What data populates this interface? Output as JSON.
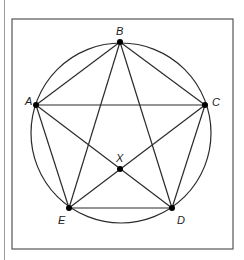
{
  "diagram": {
    "title": "",
    "frame": {
      "x": 12,
      "y": 19,
      "width": 221,
      "height": 230
    },
    "circle": {
      "cx": 121,
      "cy": 133,
      "r": 90
    },
    "points": {
      "A": {
        "label": "A",
        "x": 36,
        "y": 105,
        "label_x": 25,
        "label_y": 105
      },
      "B": {
        "label": "B",
        "x": 120,
        "y": 42,
        "label_x": 116,
        "label_y": 35
      },
      "C": {
        "label": "C",
        "x": 205,
        "y": 105,
        "label_x": 212,
        "label_y": 106
      },
      "D": {
        "label": "D",
        "x": 172,
        "y": 208,
        "label_x": 177,
        "label_y": 224
      },
      "E": {
        "label": "E",
        "x": 69,
        "y": 208,
        "label_x": 58,
        "label_y": 224
      },
      "X": {
        "label": "X",
        "x": 120,
        "y": 169,
        "label_x": 116,
        "label_y": 162
      }
    },
    "segments": [
      [
        "A",
        "B"
      ],
      [
        "B",
        "C"
      ],
      [
        "A",
        "C"
      ],
      [
        "A",
        "E"
      ],
      [
        "C",
        "D"
      ],
      [
        "E",
        "D"
      ],
      [
        "B",
        "E"
      ],
      [
        "B",
        "D"
      ],
      [
        "A",
        "D"
      ],
      [
        "C",
        "E"
      ]
    ],
    "colors": {
      "stroke": "#2b2b2b",
      "frame": "#555555",
      "point": "#000000"
    }
  }
}
